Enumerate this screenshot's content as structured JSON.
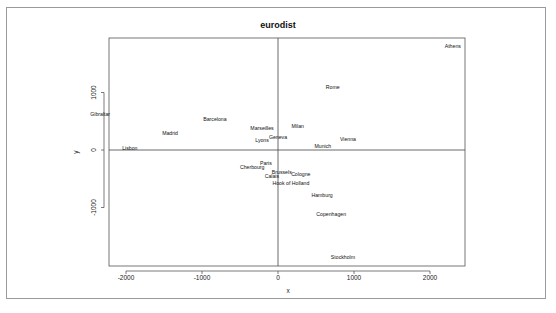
{
  "chart_data": {
    "type": "scatter",
    "title": "eurodist",
    "xlabel": "x",
    "ylabel": "y",
    "xlim": [
      -2250,
      2500
    ],
    "ylim": [
      -2030,
      1950
    ],
    "xticks": [
      -2000,
      -1000,
      0,
      1000,
      2000
    ],
    "xtick_labels": [
      "-2000",
      "-1000",
      "0",
      "1000",
      "2000"
    ],
    "yticks": [
      -1000,
      0,
      1000
    ],
    "ytick_labels": [
      "-1000",
      "0",
      "1000"
    ],
    "grid": false,
    "reference_lines": {
      "x": 0,
      "y": 0
    },
    "marker": "text-labels",
    "points": [
      {
        "label": "Athens",
        "x": 2300,
        "y": 1800
      },
      {
        "label": "Rome",
        "x": 720,
        "y": 1095
      },
      {
        "label": "Gibraltar",
        "x": -2340,
        "y": 625
      },
      {
        "label": "Barcelona",
        "x": -830,
        "y": 540
      },
      {
        "label": "Madrid",
        "x": -1420,
        "y": 295
      },
      {
        "label": "Marseilles",
        "x": -210,
        "y": 380
      },
      {
        "label": "Milan",
        "x": 260,
        "y": 415
      },
      {
        "label": "Geneva",
        "x": 0,
        "y": 225
      },
      {
        "label": "Lyons",
        "x": -210,
        "y": 175
      },
      {
        "label": "Vienna",
        "x": 920,
        "y": 190
      },
      {
        "label": "Munich",
        "x": 590,
        "y": 70
      },
      {
        "label": "Lisbon",
        "x": -1950,
        "y": 35
      },
      {
        "label": "Paris",
        "x": -160,
        "y": -225
      },
      {
        "label": "Cherbourg",
        "x": -340,
        "y": -295
      },
      {
        "label": "Brussels",
        "x": 50,
        "y": -380
      },
      {
        "label": "Calais",
        "x": -80,
        "y": -450
      },
      {
        "label": "Cologne",
        "x": 300,
        "y": -415
      },
      {
        "label": "Hook of Holland",
        "x": 170,
        "y": -575
      },
      {
        "label": "Hamburg",
        "x": 580,
        "y": -780
      },
      {
        "label": "Copenhagen",
        "x": 700,
        "y": -1115
      },
      {
        "label": "Stockholm",
        "x": 855,
        "y": -1860
      }
    ]
  }
}
